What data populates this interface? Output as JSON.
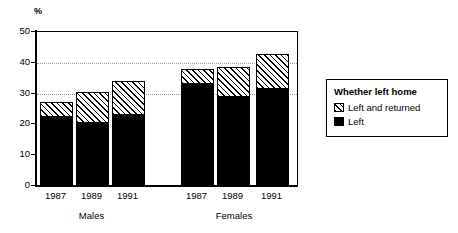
{
  "chart_data": {
    "type": "bar",
    "title": "",
    "subtitle": "",
    "xlabel": "",
    "ylabel": "%",
    "ylim": [
      0,
      50
    ],
    "yticks": [
      0,
      10,
      20,
      30,
      40,
      50
    ],
    "ytick_labels": [
      "0",
      "10",
      "20",
      "30",
      "40",
      "50"
    ],
    "gridlines_at": [
      30,
      40
    ],
    "grid": true,
    "stacked": true,
    "legend_position": "right",
    "legend_title": "Whether left home",
    "categories": [
      "1987",
      "1989",
      "1991",
      "1987",
      "1989",
      "1991"
    ],
    "groups": [
      {
        "label": "Males",
        "categories": [
          "1987",
          "1989",
          "1991"
        ],
        "series": [
          {
            "name": "Left",
            "values": [
              22.4,
              20.5,
              23.2
            ]
          },
          {
            "name": "Left and returned",
            "values": [
              4.9,
              10.0,
              10.8
            ]
          }
        ],
        "totals": [
          27.3,
          30.5,
          34.0
        ]
      },
      {
        "label": "Females",
        "categories": [
          "1987",
          "1989",
          "1991"
        ],
        "series": [
          {
            "name": "Left",
            "values": [
              33.0,
              28.8,
              31.5
            ]
          },
          {
            "name": "Left and returned",
            "values": [
              5.0,
              9.7,
              11.3
            ]
          }
        ],
        "totals": [
          38.0,
          38.5,
          42.8
        ]
      }
    ],
    "series": [
      {
        "name": "Left",
        "values": [
          22.4,
          20.5,
          23.2,
          33.0,
          28.8,
          31.5
        ]
      },
      {
        "name": "Left and returned",
        "values": [
          4.9,
          10.0,
          10.8,
          5.0,
          9.7,
          11.3
        ]
      }
    ]
  },
  "axis": {
    "unit_label": "%",
    "y_ticks": [
      "0",
      "10",
      "20",
      "30",
      "40",
      "50"
    ]
  },
  "x_labels": {
    "males": [
      "1987",
      "1989",
      "1991"
    ],
    "females": [
      "1987",
      "1989",
      "1991"
    ]
  },
  "group_labels": {
    "males": "Males",
    "females": "Females"
  },
  "legend": {
    "title": "Whether left home",
    "items": [
      {
        "label": "Left and returned",
        "swatch": "hatched"
      },
      {
        "label": "Left",
        "swatch": "solid-black"
      }
    ]
  },
  "colors": {
    "bar_left": "#000000",
    "bar_returned_hatch": "#000000",
    "bar_returned_fill": "#ffffff",
    "axis": "#000000",
    "gridline": "#9a9a9a",
    "background": "#ffffff"
  }
}
